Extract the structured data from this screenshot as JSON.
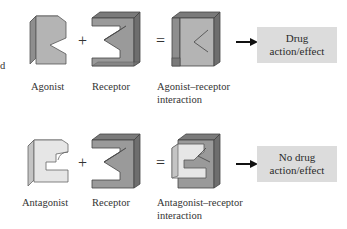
{
  "edge_fragment": "d",
  "rows": [
    {
      "name": "agonist-row",
      "ligand_label": "Agonist",
      "plus": "+",
      "receptor_label": "Receptor",
      "equals": "=",
      "complex_label_line1": "Agonist–receptor",
      "complex_label_line2": "interaction",
      "outcome_line1": "Drug",
      "outcome_line2": "action/effect"
    },
    {
      "name": "antagonist-row",
      "ligand_label": "Antagonist",
      "plus": "+",
      "receptor_label": "Receptor",
      "equals": "=",
      "complex_label_line1": "Antagonist–receptor",
      "complex_label_line2": "interaction",
      "outcome_line1": "No drug",
      "outcome_line2": "action/effect"
    }
  ],
  "colors": {
    "agonist_face": "#b4b4b4",
    "agonist_side": "#8e8e8e",
    "antagonist_face": "#e6e6e6",
    "antagonist_side": "#c4c4c4",
    "receptor_face": "#9a9a9a",
    "receptor_dark": "#6e6e6e",
    "outcome_box": "#dcdcdc"
  }
}
